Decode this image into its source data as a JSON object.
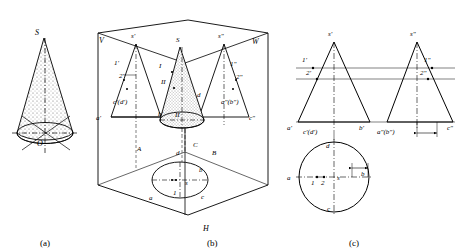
{
  "figure": {
    "title_parts": [
      "(a)",
      "(b)",
      "(c)"
    ],
    "captions": [
      {
        "name": "caption-a",
        "text": "(a)",
        "x": 46,
        "y": 243
      },
      {
        "name": "caption-b",
        "text": "(b)",
        "x": 213,
        "y": 243
      },
      {
        "name": "caption-c",
        "text": "(c)",
        "x": 355,
        "y": 243
      }
    ],
    "panel_a": {
      "name": "pictorial-cone",
      "labels": [
        {
          "text": "S",
          "x": 38,
          "y": 32
        },
        {
          "text": "O",
          "x": 40,
          "y": 143
        }
      ]
    },
    "panel_b": {
      "name": "three-plane-projection-box",
      "plane_labels": [
        {
          "text": "V",
          "x": 102,
          "y": 40
        },
        {
          "text": "W",
          "x": 255,
          "y": 41
        },
        {
          "text": "H",
          "x": 206,
          "y": 228
        }
      ],
      "labels": [
        {
          "text": "s'",
          "x": 134,
          "y": 35
        },
        {
          "text": "S",
          "x": 179,
          "y": 39
        },
        {
          "text": "s\"",
          "x": 221,
          "y": 35
        },
        {
          "text": "1'",
          "x": 117,
          "y": 62
        },
        {
          "text": "2'",
          "x": 123,
          "y": 74
        },
        {
          "text": "I",
          "x": 161,
          "y": 65
        },
        {
          "text": "1\"",
          "x": 233,
          "y": 63
        },
        {
          "text": "2\"",
          "x": 239,
          "y": 75
        },
        {
          "text": "II",
          "x": 164,
          "y": 80
        },
        {
          "text": "c'(d')",
          "x": 122,
          "y": 101
        },
        {
          "text": "d",
          "x": 199,
          "y": 94
        },
        {
          "text": "a\"(b\")",
          "x": 225,
          "y": 101
        },
        {
          "text": "a'",
          "x": 99,
          "y": 117
        },
        {
          "text": "b'",
          "x": 161,
          "y": 113
        },
        {
          "text": "II",
          "x": 178,
          "y": 114
        },
        {
          "text": "c\"",
          "x": 252,
          "y": 117
        },
        {
          "text": "A",
          "x": 140,
          "y": 148
        },
        {
          "text": "C",
          "x": 196,
          "y": 144
        },
        {
          "text": "B",
          "x": 215,
          "y": 152
        },
        {
          "text": "d",
          "x": 178,
          "y": 152
        },
        {
          "text": "b",
          "x": 201,
          "y": 169
        },
        {
          "text": "a",
          "x": 152,
          "y": 197
        },
        {
          "text": "1",
          "x": 175,
          "y": 192
        },
        {
          "text": "c",
          "x": 203,
          "y": 196
        },
        {
          "text": "s",
          "x": 187,
          "y": 182
        }
      ]
    },
    "panel_c": {
      "name": "orthographic-views",
      "front_view": {
        "name": "front-view",
        "labels": [
          {
            "text": "s'",
            "x": 331,
            "y": 33
          },
          {
            "text": "1'",
            "x": 305,
            "y": 59
          },
          {
            "text": "2'",
            "x": 310,
            "y": 72
          },
          {
            "text": "a'",
            "x": 290,
            "y": 126
          },
          {
            "text": "c'(d')",
            "x": 312,
            "y": 131
          },
          {
            "text": "b'",
            "x": 362,
            "y": 126
          }
        ]
      },
      "side_view": {
        "name": "side-view",
        "labels": [
          {
            "text": "s\"",
            "x": 413,
            "y": 33
          },
          {
            "text": "1\"",
            "x": 427,
            "y": 59
          },
          {
            "text": "2\"",
            "x": 423,
            "y": 72
          },
          {
            "text": "a\"(b\")",
            "x": 382,
            "y": 131
          },
          {
            "text": "c\"",
            "x": 450,
            "y": 126
          }
        ]
      },
      "top_view": {
        "name": "top-view",
        "labels": [
          {
            "text": "d",
            "x": 329,
            "y": 145
          },
          {
            "text": "a",
            "x": 290,
            "y": 177
          },
          {
            "text": "1",
            "x": 314,
            "y": 181
          },
          {
            "text": "2",
            "x": 324,
            "y": 181
          },
          {
            "text": "s",
            "x": 334,
            "y": 177
          },
          {
            "text": "b",
            "x": 364,
            "y": 173
          },
          {
            "text": "c",
            "x": 330,
            "y": 208
          }
        ]
      }
    }
  }
}
